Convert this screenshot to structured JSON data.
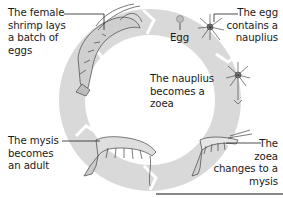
{
  "diagram": {
    "colors": {
      "ring": "#d8d8d8",
      "ring_edge": "#c4c4c4",
      "separator": "#ffffff",
      "text": "#1a1a1a",
      "leader_line": "#222222"
    },
    "stages": [
      {
        "id": "adult-female",
        "label": "The female\nshrimp lays\na batch of\neggs"
      },
      {
        "id": "egg",
        "label": "Egg"
      },
      {
        "id": "nauplius",
        "label": "The egg\ncontains a\nnauplius"
      },
      {
        "id": "zoea",
        "label": "The nauplius\nbecomes a\nzoea"
      },
      {
        "id": "mysis",
        "label": "The\nzoea\nchanges to a\nmysis"
      },
      {
        "id": "adult",
        "label": "The mysis\nbecomes\nan adult"
      }
    ]
  }
}
